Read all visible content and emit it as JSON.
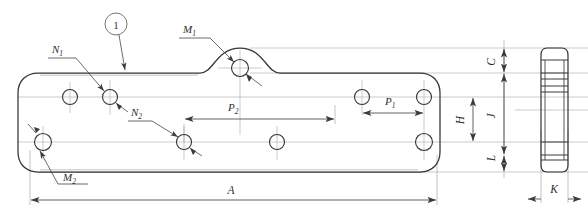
{
  "drawing": {
    "type": "engineering-technical-drawing",
    "title": "Mounting plate bracket - front view and side view",
    "background_color": "#ffffff",
    "outline_color": "#3a3a3a",
    "centerline_color": "#9a9a9a",
    "dimension_color": "#4a4a4a",
    "views": {
      "front": {
        "name": "front-view",
        "description": "Long flat plate, rounded corners, raised hump at top center-left, eight mounting holes"
      },
      "side": {
        "name": "side-view",
        "description": "Narrow vertical section profile at far right"
      }
    },
    "callouts": [
      {
        "id": "balloon-1",
        "label": "1",
        "shape": "circle",
        "x": 116,
        "y": 24
      }
    ],
    "labels": [
      {
        "id": "label-N1",
        "base": "N",
        "sub": "1",
        "x": 52,
        "y": 51,
        "rotated": false
      },
      {
        "id": "label-N2",
        "base": "N",
        "sub": "2",
        "x": 133,
        "y": 114,
        "rotated": false
      },
      {
        "id": "label-M1",
        "base": "M",
        "sub": "1",
        "x": 183,
        "y": 31,
        "rotated": false
      },
      {
        "id": "label-M2",
        "base": "M",
        "sub": "2",
        "x": 63,
        "y": 177,
        "rotated": false
      },
      {
        "id": "label-P1",
        "base": "P",
        "sub": "1",
        "x": 389,
        "y": 101,
        "rotated": false
      },
      {
        "id": "label-P2",
        "base": "P",
        "sub": "2",
        "x": 232,
        "y": 107,
        "rotated": false
      },
      {
        "id": "label-A",
        "base": "A",
        "sub": "",
        "x": 231,
        "y": 190,
        "rotated": false
      },
      {
        "id": "label-H",
        "base": "H",
        "sub": "",
        "x": 464,
        "y": 117,
        "rotated": true
      },
      {
        "id": "label-C",
        "base": "C",
        "sub": "",
        "x": 495,
        "y": 60,
        "rotated": true
      },
      {
        "id": "label-J",
        "base": "J",
        "sub": "",
        "x": 495,
        "y": 113,
        "rotated": true
      },
      {
        "id": "label-L",
        "base": "L",
        "sub": "",
        "x": 495,
        "y": 155,
        "rotated": true
      },
      {
        "id": "label-K",
        "base": "K",
        "sub": "",
        "x": 553,
        "y": 190,
        "rotated": false
      }
    ],
    "holes": [
      {
        "id": "hole-upper-left-end",
        "cx": 70,
        "cy": 97,
        "r": 7.5
      },
      {
        "id": "hole-upper-inner-left",
        "cx": 110,
        "cy": 97,
        "r": 7.5
      },
      {
        "id": "hole-upper-hump",
        "cx": 240,
        "cy": 68,
        "r": 8.5
      },
      {
        "id": "hole-upper-mid-right",
        "cx": 362,
        "cy": 97,
        "r": 7.5
      },
      {
        "id": "hole-upper-right-end",
        "cx": 424,
        "cy": 97,
        "r": 7.5
      },
      {
        "id": "hole-lower-left-end",
        "cx": 43,
        "cy": 142,
        "r": 8.5
      },
      {
        "id": "hole-lower-inner-left",
        "cx": 184,
        "cy": 142,
        "r": 7.5
      },
      {
        "id": "hole-lower-mid",
        "cx": 277,
        "cy": 142,
        "r": 7.5
      },
      {
        "id": "hole-lower-right-end",
        "cx": 424,
        "cy": 142,
        "r": 8.5
      }
    ],
    "dimensions": [
      {
        "id": "dim-P2",
        "orientation": "horizontal",
        "from": 184,
        "to": 335,
        "y": 119
      },
      {
        "id": "dim-P1",
        "orientation": "horizontal",
        "from": 362,
        "to": 424,
        "y": 113
      },
      {
        "id": "dim-A",
        "orientation": "horizontal",
        "from": 30,
        "to": 437,
        "y": 200
      },
      {
        "id": "dim-K",
        "orientation": "horizontal",
        "from": 541,
        "to": 568,
        "y": 199
      },
      {
        "id": "dim-H",
        "orientation": "vertical",
        "from": 97,
        "to": 142,
        "x": 473
      },
      {
        "id": "dim-C",
        "orientation": "vertical",
        "from": 48,
        "to": 73,
        "x": 504
      },
      {
        "id": "dim-J",
        "orientation": "vertical",
        "from": 73,
        "to": 155,
        "x": 504
      },
      {
        "id": "dim-L",
        "orientation": "vertical",
        "from": 155,
        "to": 172,
        "x": 504
      }
    ]
  }
}
